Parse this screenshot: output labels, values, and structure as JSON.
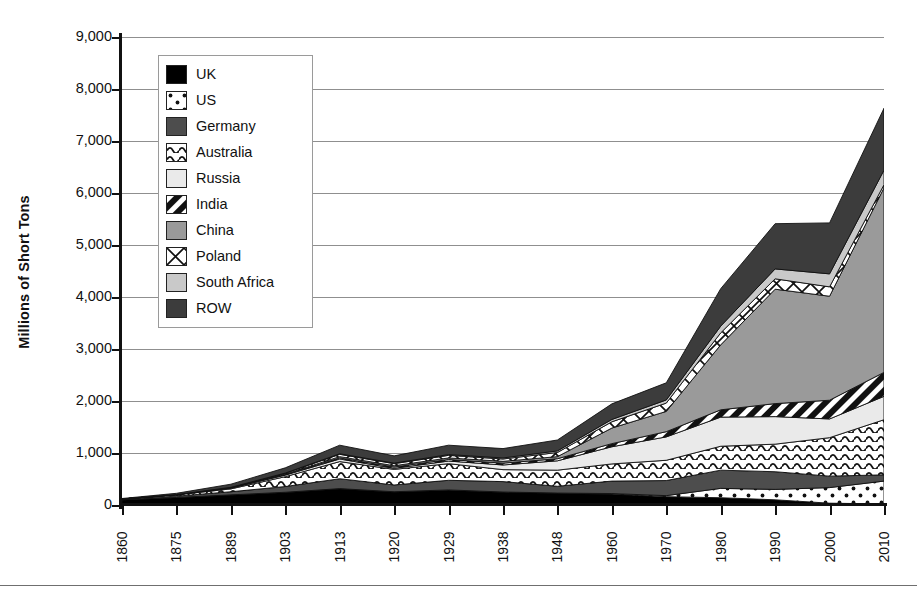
{
  "chart_data": {
    "type": "area",
    "title": "",
    "xlabel": "",
    "ylabel": "Millions of Short Tons",
    "ylim": [
      0,
      9000
    ],
    "yticks": [
      0,
      1000,
      2000,
      3000,
      4000,
      5000,
      6000,
      7000,
      8000,
      9000
    ],
    "ytick_labels": [
      "0",
      "1,000",
      "2,000",
      "3,000",
      "4,000",
      "5,000",
      "6,000",
      "7,000",
      "8,000",
      "9,000"
    ],
    "grid": true,
    "stacked": true,
    "legend_position": "upper-left-inside",
    "categories": [
      "1860",
      "1875",
      "1889",
      "1903",
      "1913",
      "1920",
      "1929",
      "1938",
      "1948",
      "1960",
      "1970",
      "1980",
      "1990",
      "2000",
      "2010"
    ],
    "series": [
      {
        "name": "UK",
        "pattern": "solid-black",
        "color": "#000000",
        "values": [
          100,
          145,
          195,
          245,
          315,
          255,
          290,
          250,
          230,
          210,
          160,
          140,
          100,
          35,
          20
        ]
      },
      {
        "name": "US",
        "pattern": "dots",
        "color": "#ffffff",
        "values": [
          0,
          0,
          0,
          0,
          0,
          0,
          0,
          0,
          0,
          10,
          20,
          180,
          200,
          300,
          440
        ]
      },
      {
        "name": "Germany",
        "pattern": "solid-darkgray",
        "color": "#4d4d4d",
        "values": [
          10,
          25,
          60,
          110,
          190,
          130,
          185,
          200,
          130,
          240,
          290,
          350,
          340,
          220,
          120
        ]
      },
      {
        "name": "Australia",
        "pattern": "waves",
        "color": "#ffffff",
        "values": [
          5,
          25,
          55,
          190,
          330,
          300,
          320,
          230,
          310,
          330,
          390,
          460,
          530,
          740,
          1060
        ]
      },
      {
        "name": "Russia",
        "pattern": "solid-verylight",
        "color": "#eaeaea",
        "values": [
          0,
          5,
          15,
          30,
          50,
          20,
          50,
          90,
          180,
          330,
          450,
          560,
          530,
          360,
          450
        ]
      },
      {
        "name": "India",
        "pattern": "diagonal",
        "color": "#000000",
        "values": [
          0,
          0,
          5,
          10,
          20,
          25,
          30,
          35,
          40,
          60,
          100,
          140,
          250,
          360,
          460
        ]
      },
      {
        "name": "China",
        "pattern": "solid-midgray",
        "color": "#9a9a9a",
        "values": [
          0,
          0,
          5,
          10,
          25,
          25,
          30,
          35,
          40,
          300,
          390,
          1250,
          2200,
          2000,
          3550
        ]
      },
      {
        "name": "Poland",
        "pattern": "cross",
        "color": "#ffffff",
        "values": [
          0,
          0,
          5,
          15,
          45,
          40,
          50,
          45,
          80,
          120,
          160,
          230,
          200,
          180,
          60
        ]
      },
      {
        "name": "South Africa",
        "pattern": "solid-light",
        "color": "#c9c9c9",
        "values": [
          0,
          0,
          0,
          5,
          10,
          10,
          15,
          20,
          30,
          45,
          60,
          130,
          190,
          250,
          280
        ]
      },
      {
        "name": "ROW",
        "pattern": "solid-charcoal",
        "color": "#3c3c3c",
        "values": [
          10,
          25,
          60,
          100,
          165,
          140,
          180,
          180,
          210,
          300,
          330,
          720,
          870,
          980,
          1190
        ]
      }
    ]
  },
  "axis": {
    "y_title": "Millions of Short Tons"
  },
  "legend": {
    "items": [
      {
        "label": "UK",
        "pattern": "solid-black"
      },
      {
        "label": "US",
        "pattern": "dots"
      },
      {
        "label": "Germany",
        "pattern": "solid-darkgray"
      },
      {
        "label": "Australia",
        "pattern": "waves"
      },
      {
        "label": "Russia",
        "pattern": "solid-verylight"
      },
      {
        "label": "India",
        "pattern": "diagonal"
      },
      {
        "label": "China",
        "pattern": "solid-midgray"
      },
      {
        "label": "Poland",
        "pattern": "cross"
      },
      {
        "label": "South Africa",
        "pattern": "solid-light"
      },
      {
        "label": "ROW",
        "pattern": "solid-charcoal"
      }
    ]
  },
  "colors": {
    "uk": "#000000",
    "germany": "#4d4d4d",
    "russia": "#eaeaea",
    "china": "#9a9a9a",
    "south_africa": "#c9c9c9",
    "row": "#3c3c3c",
    "axis": "#111111",
    "gridline": "#8f8f8f"
  }
}
